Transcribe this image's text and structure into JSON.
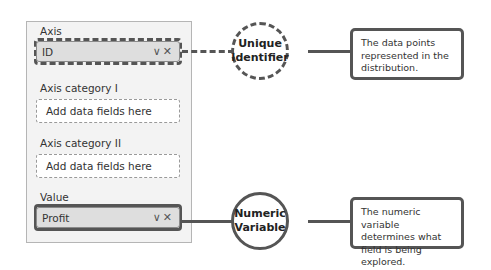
{
  "panel": {
    "sections": [
      {
        "label": "Axis",
        "value": "ID",
        "state": "filled"
      },
      {
        "label": "Axis category I",
        "placeholder": "Add data fields here",
        "state": "empty"
      },
      {
        "label": "Axis category II",
        "placeholder": "Add data fields here",
        "state": "empty"
      },
      {
        "label": "Value",
        "value": "Profit",
        "state": "filled"
      }
    ],
    "field_icons": "∨✕"
  },
  "callouts": [
    {
      "title_line1": "Unique",
      "title_line2": "Identifier",
      "style": "dashed",
      "note": "The data points represented in the distribution."
    },
    {
      "title_line1": "Numeric",
      "title_line2": "Variable",
      "style": "solid",
      "note": "The numeric variable determines what field is being explored."
    }
  ],
  "colors": {
    "accent": "#555555",
    "panel_bg": "#f3f3f3",
    "field_bg": "#dedede"
  }
}
